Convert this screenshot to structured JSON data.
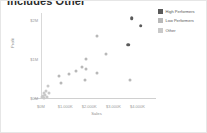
{
  "card": {
    "title": "Includes Other"
  },
  "legend": {
    "position": "right",
    "items": [
      {
        "label": "High Performers",
        "color": "#5a5a5a",
        "name": "legend-high-performers"
      },
      {
        "label": "Low Performers",
        "color": "#b8b8b8",
        "name": "legend-low-performers"
      },
      {
        "label": "Other",
        "color": "#c9c9c9",
        "name": "legend-other"
      }
    ]
  },
  "axes": {
    "x_title": "Sales",
    "y_title": "Profit",
    "x_ticks": [
      "$0M",
      "$1.000K",
      "$2.000K",
      "$3.000K",
      "$4.000K"
    ],
    "y_ticks": [
      "$2M",
      "$1M",
      "$0M"
    ]
  },
  "chart_data": {
    "type": "scatter",
    "title": "Includes Other",
    "xlabel": "Sales",
    "ylabel": "Profit",
    "xlim": [
      0,
      4600
    ],
    "ylim": [
      0,
      2200
    ],
    "grid": false,
    "legend_position": "right",
    "x_tick_values": [
      0,
      1000,
      2000,
      3000,
      4000
    ],
    "x_tick_labels": [
      "$0M",
      "$1.000K",
      "$2.000K",
      "$3.000K",
      "$4.000K"
    ],
    "y_tick_values": [
      0,
      1000,
      2000
    ],
    "y_tick_labels": [
      "$0M",
      "$1M",
      "$2M"
    ],
    "series": [
      {
        "name": "High Performers",
        "color": "#5a5a5a",
        "points": [
          {
            "x": 3760,
            "y": 2060
          },
          {
            "x": 4130,
            "y": 1870
          },
          {
            "x": 3610,
            "y": 1380
          }
        ]
      },
      {
        "name": "Low Performers",
        "color": "#b8b8b8",
        "points": [
          {
            "x": 2330,
            "y": 1610
          },
          {
            "x": 2690,
            "y": 1140
          },
          {
            "x": 1860,
            "y": 1010
          },
          {
            "x": 1700,
            "y": 790
          },
          {
            "x": 1880,
            "y": 760
          },
          {
            "x": 1460,
            "y": 700
          },
          {
            "x": 2300,
            "y": 640
          },
          {
            "x": 1160,
            "y": 620
          },
          {
            "x": 1830,
            "y": 470
          },
          {
            "x": 3690,
            "y": 470
          },
          {
            "x": 760,
            "y": 560
          },
          {
            "x": 820,
            "y": 380
          }
        ]
      },
      {
        "name": "Other",
        "color": "#c9c9c9",
        "points": [
          {
            "x": 300,
            "y": 310
          },
          {
            "x": 190,
            "y": 180
          },
          {
            "x": 330,
            "y": 140
          },
          {
            "x": 110,
            "y": 120
          },
          {
            "x": 150,
            "y": 70
          },
          {
            "x": 90,
            "y": 40
          },
          {
            "x": 240,
            "y": 30
          },
          {
            "x": 60,
            "y": 20
          },
          {
            "x": 130,
            "y": 10
          }
        ]
      }
    ]
  }
}
